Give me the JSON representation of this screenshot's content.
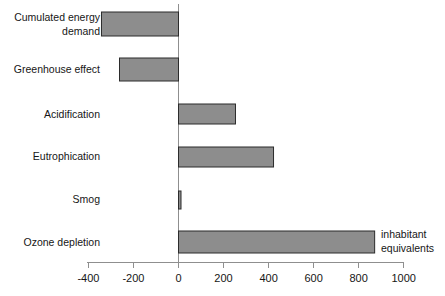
{
  "chart_data": {
    "type": "bar",
    "orientation": "horizontal",
    "title": "",
    "subtitle": "",
    "xlabel": "inhabitant equivalents",
    "ylabel": "",
    "categories": [
      "Cumulated energy demand",
      "Greenhouse effect",
      "Acidification",
      "Eutrophication",
      "Smog",
      "Ozone depletion"
    ],
    "category_lines": [
      [
        "Cumulated energy",
        "demand"
      ],
      [
        "Greenhouse effect"
      ],
      [
        "Acidification"
      ],
      [
        "Eutrophication"
      ],
      [
        "Smog"
      ],
      [
        "Ozone depletion"
      ]
    ],
    "values": [
      -342,
      -262,
      253,
      422,
      10,
      871
    ],
    "xlim": [
      -400,
      1000
    ],
    "xticks": [
      -400,
      -200,
      0,
      200,
      400,
      600,
      800,
      1000
    ],
    "xticklabels": [
      "-400",
      "-200",
      "0",
      "200",
      "400",
      "600",
      "800",
      "1000"
    ],
    "grid": false,
    "legend": false,
    "bar_color": "#8d8d8d",
    "bar_edge_color": "#2b2b2b",
    "axis_color": "#8f8f8f"
  },
  "annotations": {
    "unit_line_1": "inhabitant",
    "unit_line_2": "equivalents"
  }
}
